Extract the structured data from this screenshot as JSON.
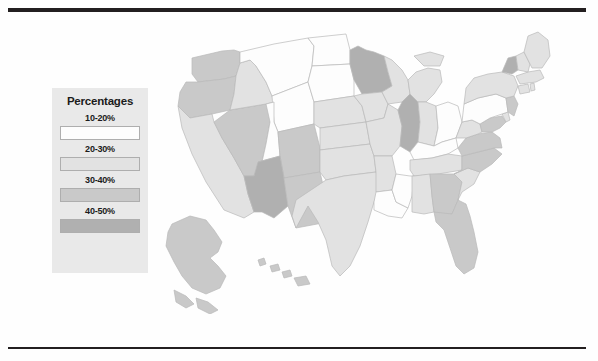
{
  "page": {
    "background_color": "#fefefe",
    "rule_color": "#231f20"
  },
  "legend": {
    "title": "Percentages",
    "background_color": "#e9e9e9",
    "border_color": "#aeaeae",
    "entries": [
      {
        "label": "10-20%",
        "color": "#fdfdfd"
      },
      {
        "label": "20-30%",
        "color": "#e2e2e2"
      },
      {
        "label": "30-40%",
        "color": "#c9c9c9"
      },
      {
        "label": "40-50%",
        "color": "#b0b0b0"
      }
    ]
  },
  "chart_data": {
    "type": "heatmap",
    "title": "Percentages",
    "xlabel": "",
    "ylabel": "",
    "legend_position": "left",
    "grid": false,
    "bins": [
      {
        "label": "10-20%",
        "color": "#fdfdfd",
        "min": 10,
        "max": 20
      },
      {
        "label": "20-30%",
        "color": "#e2e2e2",
        "min": 20,
        "max": 30
      },
      {
        "label": "30-40%",
        "color": "#c9c9c9",
        "min": 30,
        "max": 40
      },
      {
        "label": "40-50%",
        "color": "#b0b0b0",
        "min": 40,
        "max": 50
      }
    ],
    "categories": [
      "Washington",
      "Oregon",
      "California",
      "Nevada",
      "Idaho",
      "Montana",
      "Wyoming",
      "Utah",
      "Colorado",
      "Arizona",
      "New Mexico",
      "North Dakota",
      "South Dakota",
      "Nebraska",
      "Kansas",
      "Oklahoma",
      "Texas",
      "Minnesota",
      "Iowa",
      "Missouri",
      "Arkansas",
      "Louisiana",
      "Wisconsin",
      "Illinois",
      "Michigan",
      "Indiana",
      "Ohio",
      "Kentucky",
      "Tennessee",
      "Mississippi",
      "Alabama",
      "Georgia",
      "Florida",
      "South Carolina",
      "North Carolina",
      "Virginia",
      "West Virginia",
      "Maryland",
      "Delaware",
      "Pennsylvania",
      "New Jersey",
      "New York",
      "Connecticut",
      "Rhode Island",
      "Massachusetts",
      "Vermont",
      "New Hampshire",
      "Maine",
      "Alaska",
      "Hawaii"
    ],
    "values": [
      "30-40%",
      "30-40%",
      "20-30%",
      "30-40%",
      "20-30%",
      "10-20%",
      "10-20%",
      "10-20%",
      "30-40%",
      "40-50%",
      "30-40%",
      "10-20%",
      "10-20%",
      "20-30%",
      "20-30%",
      "20-30%",
      "20-30%",
      "40-50%",
      "20-30%",
      "20-30%",
      "20-30%",
      "10-20%",
      "20-30%",
      "40-50%",
      "20-30%",
      "20-30%",
      "10-20%",
      "10-20%",
      "20-30%",
      "10-20%",
      "20-30%",
      "30-40%",
      "30-40%",
      "20-30%",
      "30-40%",
      "30-40%",
      "20-30%",
      "30-40%",
      "20-30%",
      "10-20%",
      "30-40%",
      "20-30%",
      "20-30%",
      "20-30%",
      "20-30%",
      "40-50%",
      "20-30%",
      "20-30%",
      "30-40%",
      "30-40%"
    ]
  },
  "map": {
    "projection": "albers-usa",
    "states": [
      {
        "name": "Washington",
        "bin": 2,
        "d": "M30 32 L60 25 L72 24 L78 26 L78 37 L74 50 L62 53 L36 56 L30 48 Z"
      },
      {
        "name": "Oregon",
        "bin": 2,
        "d": "M24 56 L36 56 L62 53 L74 50 L72 68 L68 84 L50 88 L28 92 L16 80 L18 66 Z"
      },
      {
        "name": "California",
        "bin": 1,
        "d": "M16 80 L28 92 L50 88 L52 96 L60 112 L72 132 L82 150 L86 168 L92 186 L82 192 L62 184 L44 156 L30 128 L20 102 Z"
      },
      {
        "name": "Nevada",
        "bin": 2,
        "d": "M68 84 L104 78 L112 76 L108 96 L104 118 L100 136 L92 150 L82 150 L72 132 L60 112 L52 96 Z"
      },
      {
        "name": "Idaho",
        "bin": 1,
        "d": "M74 50 L78 37 L88 34 L94 40 L104 56 L110 70 L112 76 L104 78 L68 84 L72 68 Z"
      },
      {
        "name": "Montana",
        "bin": 0,
        "d": "M78 26 L112 18 L146 12 L152 20 L150 40 L146 56 L110 70 L104 56 L94 40 L88 34 L78 37 Z"
      },
      {
        "name": "Wyoming",
        "bin": 0,
        "d": "M110 70 L146 56 L152 76 L152 98 L116 106 L112 96 Z"
      },
      {
        "name": "Utah",
        "bin": 0,
        "d": "M104 78 L112 76 L112 96 L116 106 L118 130 L96 136 L100 136 L104 118 L108 96 Z"
      },
      {
        "name": "Colorado",
        "bin": 2,
        "d": "M116 106 L152 98 L158 122 L158 146 L122 152 L118 130 Z"
      },
      {
        "name": "Arizona",
        "bin": 3,
        "d": "M96 136 L118 130 L122 152 L126 180 L112 192 L100 186 L92 186 L86 168 L82 150 L92 150 Z"
      },
      {
        "name": "New Mexico",
        "bin": 2,
        "d": "M122 152 L158 146 L164 172 L166 196 L134 202 L126 180 Z"
      },
      {
        "name": "North Dakota",
        "bin": 0,
        "d": "M146 12 L184 8 L188 24 L188 38 L150 40 L152 20 Z"
      },
      {
        "name": "South Dakota",
        "bin": 0,
        "d": "M150 40 L188 38 L192 54 L192 70 L152 76 L146 56 Z"
      },
      {
        "name": "Nebraska",
        "bin": 1,
        "d": "M152 76 L192 70 L200 80 L204 96 L158 102 L152 98 Z"
      },
      {
        "name": "Kansas",
        "bin": 1,
        "d": "M158 102 L204 96 L208 118 L158 124 L158 122 Z"
      },
      {
        "name": "Oklahoma",
        "bin": 1,
        "d": "M158 124 L208 118 L212 130 L214 146 L182 150 L164 154 L158 146 Z"
      },
      {
        "name": "Texas",
        "bin": 1,
        "d": "M164 154 L182 150 L214 146 L218 160 L212 176 L206 196 L198 220 L188 240 L178 250 L170 240 L164 214 L156 196 L146 180 L134 202 L130 190 L134 174 Z"
      },
      {
        "name": "Minnesota",
        "bin": 3,
        "d": "M188 24 L196 20 L204 24 L212 26 L222 30 L226 46 L230 60 L220 66 L200 68 L192 54 L188 38 Z"
      },
      {
        "name": "Iowa",
        "bin": 1,
        "d": "M192 70 L200 68 L220 66 L226 78 L222 92 L204 96 L200 80 Z"
      },
      {
        "name": "Missouri",
        "bin": 1,
        "d": "M204 96 L222 92 L226 78 L236 84 L240 100 L238 120 L230 130 L212 130 L208 118 Z"
      },
      {
        "name": "Arkansas",
        "bin": 1,
        "d": "M212 130 L230 130 L234 148 L230 164 L214 166 L214 146 Z"
      },
      {
        "name": "Louisiana",
        "bin": 0,
        "d": "M214 166 L230 164 L234 176 L246 182 L240 192 L226 190 L212 184 L212 176 Z"
      },
      {
        "name": "Wisconsin",
        "bin": 1,
        "d": "M222 30 L230 34 L240 44 L246 54 L248 68 L240 76 L226 78 L220 66 L230 60 L226 46 Z"
      },
      {
        "name": "Illinois",
        "bin": 3,
        "d": "M240 76 L248 68 L256 76 L258 96 L256 116 L248 126 L238 120 L240 100 L236 84 Z"
      },
      {
        "name": "Michigan",
        "bin": 1,
        "d": "M246 54 L254 46 L266 42 L278 44 L280 56 L272 68 L264 76 L256 76 L248 68 Z M252 30 L268 26 L282 30 L278 40 L262 40 Z"
      },
      {
        "name": "Indiana",
        "bin": 1,
        "d": "M256 76 L264 76 L274 80 L276 102 L272 120 L256 116 L258 96 Z"
      },
      {
        "name": "Ohio",
        "bin": 0,
        "d": "M274 80 L286 76 L296 80 L300 96 L294 112 L280 116 L272 120 L276 102 Z"
      },
      {
        "name": "Kentucky",
        "bin": 0,
        "d": "M256 116 L272 120 L280 116 L294 112 L296 122 L286 128 L270 132 L252 134 L248 126 Z"
      },
      {
        "name": "Tennessee",
        "bin": 1,
        "d": "M248 134 L270 132 L286 128 L300 130 L300 144 L276 148 L252 150 L248 144 Z"
      },
      {
        "name": "Mississippi",
        "bin": 0,
        "d": "M230 164 L234 148 L248 150 L252 150 L250 170 L246 182 L234 176 Z"
      },
      {
        "name": "Alabama",
        "bin": 1,
        "d": "M250 150 L252 150 L268 148 L270 170 L272 186 L262 188 L250 186 L250 170 Z"
      },
      {
        "name": "Georgia",
        "bin": 2,
        "d": "M268 148 L276 148 L292 148 L300 156 L296 174 L290 188 L276 190 L272 186 L270 170 Z"
      },
      {
        "name": "Florida",
        "bin": 2,
        "d": "M272 186 L290 188 L296 174 L304 178 L308 190 L312 206 L316 226 L312 242 L302 248 L294 240 L288 222 L282 204 L274 196 Z"
      },
      {
        "name": "South Carolina",
        "bin": 1,
        "d": "M292 148 L306 142 L318 146 L312 158 L300 166 L296 174 L300 156 Z"
      },
      {
        "name": "North Carolina",
        "bin": 2,
        "d": "M300 130 L316 126 L332 122 L340 128 L330 138 L318 146 L306 142 L292 148 L300 144 Z"
      },
      {
        "name": "Virginia",
        "bin": 2,
        "d": "M296 122 L304 112 L316 108 L330 106 L338 112 L340 122 L332 122 L316 126 L300 130 Z"
      },
      {
        "name": "West Virginia",
        "bin": 1,
        "d": "M294 112 L300 96 L310 94 L318 98 L320 106 L316 108 L304 112 Z"
      },
      {
        "name": "Maryland",
        "bin": 2,
        "d": "M318 98 L328 92 L340 90 L344 96 L338 102 L330 106 L320 106 Z"
      },
      {
        "name": "Delaware",
        "bin": 1,
        "d": "M340 88 L346 86 L348 94 L344 96 Z"
      },
      {
        "name": "Pennsylvania",
        "bin": 0,
        "d": "M300 96 L302 78 L316 72 L334 68 L344 72 L346 86 L340 88 L328 92 L318 98 L310 94 Z"
      },
      {
        "name": "New Jersey",
        "bin": 2,
        "d": "M344 72 L352 70 L356 78 L352 90 L346 86 Z"
      },
      {
        "name": "New York",
        "bin": 1,
        "d": "M302 78 L304 62 L312 52 L326 48 L340 46 L352 50 L356 60 L352 70 L344 72 L334 68 L316 72 Z"
      },
      {
        "name": "Connecticut",
        "bin": 1,
        "d": "M356 60 L366 58 L368 66 L358 68 Z"
      },
      {
        "name": "Rhode Island",
        "bin": 1,
        "d": "M368 58 L372 57 L373 64 L369 65 Z"
      },
      {
        "name": "Massachusetts",
        "bin": 1,
        "d": "M354 50 L366 46 L378 44 L382 52 L374 56 L358 58 Z"
      },
      {
        "name": "Vermont",
        "bin": 3,
        "d": "M340 46 L346 32 L354 30 L356 44 L350 48 Z"
      },
      {
        "name": "New Hampshire",
        "bin": 1,
        "d": "M356 44 L354 30 L362 26 L368 38 L366 46 Z"
      },
      {
        "name": "Maine",
        "bin": 1,
        "d": "M362 26 L366 10 L376 6 L386 14 L388 30 L380 42 L370 42 L368 38 Z"
      },
      {
        "name": "Alaska",
        "bin": 2,
        "d": "M10 198 L28 190 L44 194 L52 204 L60 216 L56 226 L48 232 L56 240 L64 250 L58 262 L44 268 L30 262 L20 250 L12 236 L4 220 L6 206 Z M12 264 L24 270 L32 278 L24 282 L14 276 Z M34 272 L46 276 L56 284 L48 288 L36 282 Z"
      },
      {
        "name": "Hawaii",
        "bin": 2,
        "d": "M96 234 L102 232 L104 238 L98 240 Z M108 240 L116 238 L118 244 L110 246 Z M120 246 L128 244 L130 250 L122 252 Z M132 252 L144 250 L148 258 L136 260 Z"
      }
    ]
  }
}
